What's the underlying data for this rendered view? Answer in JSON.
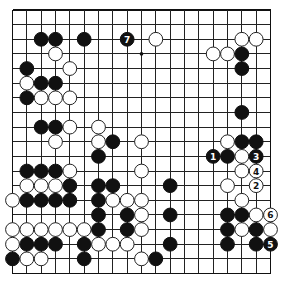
{
  "diagram": {
    "type": "go-board",
    "size": 19,
    "colors": {
      "black": "#111111",
      "white": "#ffffff",
      "line": "#222222",
      "background": "#ffffff"
    },
    "hoshi": [
      [
        9,
        3
      ]
    ],
    "stones": [
      {
        "color": "black",
        "col": 2,
        "row": 2
      },
      {
        "color": "black",
        "col": 3,
        "row": 2
      },
      {
        "color": "black",
        "col": 5,
        "row": 2
      },
      {
        "color": "black",
        "col": 8,
        "row": 2,
        "label": "7"
      },
      {
        "color": "white",
        "col": 10,
        "row": 2
      },
      {
        "color": "white",
        "col": 16,
        "row": 2
      },
      {
        "color": "white",
        "col": 17,
        "row": 2
      },
      {
        "color": "white",
        "col": 3,
        "row": 3
      },
      {
        "color": "white",
        "col": 14,
        "row": 3
      },
      {
        "color": "white",
        "col": 15,
        "row": 3
      },
      {
        "color": "black",
        "col": 16,
        "row": 3
      },
      {
        "color": "black",
        "col": 1,
        "row": 4
      },
      {
        "color": "white",
        "col": 4,
        "row": 4
      },
      {
        "color": "black",
        "col": 16,
        "row": 4
      },
      {
        "color": "white",
        "col": 1,
        "row": 5
      },
      {
        "color": "black",
        "col": 2,
        "row": 5
      },
      {
        "color": "black",
        "col": 3,
        "row": 5
      },
      {
        "color": "black",
        "col": 1,
        "row": 6
      },
      {
        "color": "white",
        "col": 2,
        "row": 6
      },
      {
        "color": "white",
        "col": 3,
        "row": 6
      },
      {
        "color": "white",
        "col": 4,
        "row": 6
      },
      {
        "color": "black",
        "col": 16,
        "row": 7
      },
      {
        "color": "black",
        "col": 2,
        "row": 8
      },
      {
        "color": "black",
        "col": 3,
        "row": 8
      },
      {
        "color": "white",
        "col": 4,
        "row": 8
      },
      {
        "color": "white",
        "col": 6,
        "row": 8
      },
      {
        "color": "white",
        "col": 3,
        "row": 9
      },
      {
        "color": "white",
        "col": 6,
        "row": 9
      },
      {
        "color": "black",
        "col": 7,
        "row": 9
      },
      {
        "color": "white",
        "col": 9,
        "row": 9
      },
      {
        "color": "white",
        "col": 15,
        "row": 9
      },
      {
        "color": "black",
        "col": 16,
        "row": 9
      },
      {
        "color": "black",
        "col": 17,
        "row": 9
      },
      {
        "color": "black",
        "col": 6,
        "row": 10
      },
      {
        "color": "black",
        "col": 14,
        "row": 10,
        "label": "1"
      },
      {
        "color": "black",
        "col": 15,
        "row": 10
      },
      {
        "color": "white",
        "col": 16,
        "row": 10
      },
      {
        "color": "black",
        "col": 17,
        "row": 10,
        "label": "3"
      },
      {
        "color": "black",
        "col": 1,
        "row": 11
      },
      {
        "color": "black",
        "col": 2,
        "row": 11
      },
      {
        "color": "black",
        "col": 3,
        "row": 11
      },
      {
        "color": "white",
        "col": 4,
        "row": 11
      },
      {
        "color": "white",
        "col": 9,
        "row": 11
      },
      {
        "color": "white",
        "col": 16,
        "row": 11
      },
      {
        "color": "white",
        "col": 17,
        "row": 11,
        "label": "4"
      },
      {
        "color": "white",
        "col": 1,
        "row": 12
      },
      {
        "color": "white",
        "col": 2,
        "row": 12
      },
      {
        "color": "white",
        "col": 3,
        "row": 12
      },
      {
        "color": "black",
        "col": 4,
        "row": 12
      },
      {
        "color": "black",
        "col": 6,
        "row": 12
      },
      {
        "color": "black",
        "col": 7,
        "row": 12
      },
      {
        "color": "black",
        "col": 11,
        "row": 12
      },
      {
        "color": "white",
        "col": 15,
        "row": 12
      },
      {
        "color": "white",
        "col": 17,
        "row": 12,
        "label": "2"
      },
      {
        "color": "white",
        "col": 0,
        "row": 13
      },
      {
        "color": "black",
        "col": 1,
        "row": 13
      },
      {
        "color": "black",
        "col": 2,
        "row": 13
      },
      {
        "color": "black",
        "col": 3,
        "row": 13
      },
      {
        "color": "black",
        "col": 4,
        "row": 13
      },
      {
        "color": "black",
        "col": 6,
        "row": 13
      },
      {
        "color": "white",
        "col": 7,
        "row": 13
      },
      {
        "color": "white",
        "col": 8,
        "row": 13
      },
      {
        "color": "white",
        "col": 9,
        "row": 13
      },
      {
        "color": "white",
        "col": 16,
        "row": 13
      },
      {
        "color": "black",
        "col": 6,
        "row": 14
      },
      {
        "color": "black",
        "col": 8,
        "row": 14
      },
      {
        "color": "white",
        "col": 9,
        "row": 14
      },
      {
        "color": "black",
        "col": 11,
        "row": 14
      },
      {
        "color": "black",
        "col": 15,
        "row": 14
      },
      {
        "color": "black",
        "col": 16,
        "row": 14
      },
      {
        "color": "white",
        "col": 17,
        "row": 14
      },
      {
        "color": "white",
        "col": 18,
        "row": 14,
        "label": "6"
      },
      {
        "color": "white",
        "col": 0,
        "row": 15
      },
      {
        "color": "white",
        "col": 1,
        "row": 15
      },
      {
        "color": "white",
        "col": 2,
        "row": 15
      },
      {
        "color": "white",
        "col": 3,
        "row": 15
      },
      {
        "color": "white",
        "col": 4,
        "row": 15
      },
      {
        "color": "white",
        "col": 5,
        "row": 15
      },
      {
        "color": "black",
        "col": 6,
        "row": 15
      },
      {
        "color": "black",
        "col": 8,
        "row": 15
      },
      {
        "color": "white",
        "col": 9,
        "row": 15
      },
      {
        "color": "black",
        "col": 15,
        "row": 15
      },
      {
        "color": "white",
        "col": 16,
        "row": 15
      },
      {
        "color": "black",
        "col": 17,
        "row": 15
      },
      {
        "color": "white",
        "col": 18,
        "row": 15
      },
      {
        "color": "white",
        "col": 0,
        "row": 16
      },
      {
        "color": "black",
        "col": 1,
        "row": 16
      },
      {
        "color": "black",
        "col": 2,
        "row": 16
      },
      {
        "color": "black",
        "col": 3,
        "row": 16
      },
      {
        "color": "black",
        "col": 5,
        "row": 16
      },
      {
        "color": "white",
        "col": 6,
        "row": 16
      },
      {
        "color": "white",
        "col": 7,
        "row": 16
      },
      {
        "color": "white",
        "col": 8,
        "row": 16
      },
      {
        "color": "black",
        "col": 11,
        "row": 16
      },
      {
        "color": "black",
        "col": 15,
        "row": 16
      },
      {
        "color": "black",
        "col": 17,
        "row": 16
      },
      {
        "color": "black",
        "col": 18,
        "row": 16,
        "label": "5"
      },
      {
        "color": "black",
        "col": 0,
        "row": 17
      },
      {
        "color": "white",
        "col": 1,
        "row": 17
      },
      {
        "color": "white",
        "col": 2,
        "row": 17
      },
      {
        "color": "black",
        "col": 5,
        "row": 17
      },
      {
        "color": "white",
        "col": 9,
        "row": 17
      },
      {
        "color": "black",
        "col": 10,
        "row": 17
      }
    ]
  }
}
